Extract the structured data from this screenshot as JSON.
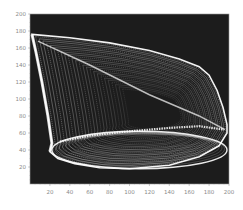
{
  "chart_data": {
    "type": "scatter",
    "style": "density / phase-portrait (white traces on black background)",
    "title": "",
    "xlabel": "",
    "ylabel": "",
    "xlim": [
      0,
      200
    ],
    "ylim": [
      0,
      200
    ],
    "grid": false,
    "legend": null,
    "x_ticks": [
      20,
      40,
      60,
      80,
      100,
      120,
      140,
      160,
      180,
      200
    ],
    "y_ticks": [
      20,
      40,
      60,
      80,
      100,
      120,
      140,
      160,
      180,
      200
    ],
    "background_color": "#1a1a1a",
    "trace_color": "#ffffff",
    "shape_outline": [
      [
        2,
        176
      ],
      [
        40,
        172
      ],
      [
        80,
        166
      ],
      [
        120,
        157
      ],
      [
        150,
        147
      ],
      [
        170,
        138
      ],
      [
        180,
        128
      ],
      [
        188,
        110
      ],
      [
        194,
        90
      ],
      [
        198,
        70
      ],
      [
        198,
        60
      ],
      [
        190,
        45
      ],
      [
        170,
        32
      ],
      [
        140,
        22
      ],
      [
        100,
        18
      ],
      [
        70,
        19
      ],
      [
        45,
        24
      ],
      [
        28,
        30
      ],
      [
        20,
        38
      ],
      [
        22,
        48
      ],
      [
        18,
        80
      ],
      [
        12,
        120
      ],
      [
        6,
        155
      ],
      [
        2,
        176
      ]
    ],
    "inner_band": [
      [
        30,
        50
      ],
      [
        60,
        57
      ],
      [
        100,
        62
      ],
      [
        140,
        66
      ],
      [
        170,
        68
      ],
      [
        195,
        64
      ]
    ],
    "diagonal_ridge": [
      [
        8,
        168
      ],
      [
        60,
        140
      ],
      [
        120,
        105
      ],
      [
        170,
        80
      ],
      [
        196,
        64
      ]
    ],
    "bottom_ellipse": {
      "cx": 110,
      "cy": 40,
      "rx": 88,
      "ry": 22
    }
  },
  "axes": {
    "x_tick_labels": [
      "20",
      "40",
      "60",
      "80",
      "100",
      "120",
      "140",
      "160",
      "180",
      "200"
    ],
    "y_tick_labels": [
      "200",
      "180",
      "160",
      "140",
      "120",
      "100",
      "80",
      "60",
      "40",
      "20"
    ]
  }
}
